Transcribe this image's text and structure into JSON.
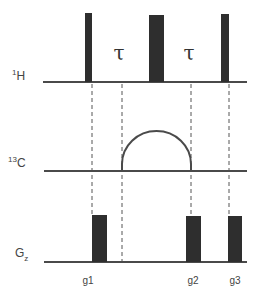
{
  "diagram": {
    "type": "nmr-pulse-sequence",
    "colors": {
      "pulse": "#2e2e2e",
      "baseline": "#4a4a4a",
      "dashed": "#555555",
      "label": "#444444"
    },
    "channels": [
      {
        "id": "1H",
        "label_sup": "1",
        "label_main": "H",
        "baseline_y": 82
      },
      {
        "id": "13C",
        "label_sup": "13",
        "label_main": "C",
        "baseline_y": 171
      },
      {
        "id": "Gz",
        "label_main": "G",
        "label_sub": "z",
        "baseline_y": 262
      }
    ],
    "delays": [
      {
        "symbol": "τ",
        "x": 119
      },
      {
        "symbol": "τ",
        "x": 189
      }
    ],
    "gradients": [
      {
        "label": "g1",
        "x": 88
      },
      {
        "label": "g2",
        "x": 193
      },
      {
        "label": "g3",
        "x": 235
      }
    ]
  }
}
